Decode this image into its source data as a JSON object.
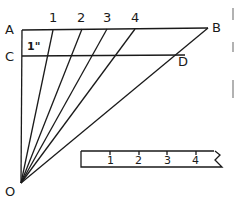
{
  "diagram": {
    "points": {
      "A": {
        "label": "A",
        "x": 22,
        "y": 30
      },
      "B": {
        "label": "B",
        "x": 208,
        "y": 28
      },
      "C": {
        "label": "C",
        "x": 22,
        "y": 56
      },
      "D": {
        "label": "D",
        "x": 185,
        "y": 55
      },
      "O": {
        "label": "O",
        "x": 20,
        "y": 183
      }
    },
    "top_divisions": [
      "1",
      "2",
      "3",
      "4"
    ],
    "segment_label": "1\"",
    "ruler": {
      "ticks": [
        "1",
        "2",
        "3",
        "4"
      ]
    },
    "colors": {
      "ink": "#1a1a1a",
      "background": "#ffffff"
    }
  }
}
